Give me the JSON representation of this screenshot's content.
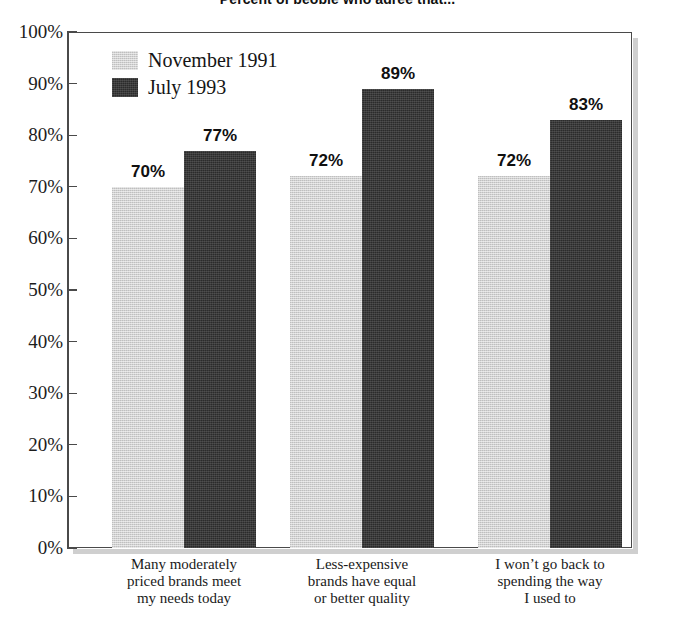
{
  "chart_data": {
    "type": "bar",
    "title": "Percent of people who agree that...",
    "xlabel": "",
    "ylabel": "",
    "ylim": [
      0,
      100
    ],
    "ytick_labels": [
      "100%",
      "90%",
      "80%",
      "70%",
      "60%",
      "50%",
      "40%",
      "30%",
      "20%",
      "10%",
      "0%"
    ],
    "ytick_values": [
      100,
      90,
      80,
      70,
      60,
      50,
      40,
      30,
      20,
      10,
      0
    ],
    "grid": false,
    "legend_position": "inside-top-left",
    "categories": [
      [
        "Many moderately",
        "priced brands meet",
        "my needs today"
      ],
      [
        "Less-expensive",
        "brands have equal",
        "or better quality"
      ],
      [
        "I won’t go back to",
        "spending the way",
        "I used to"
      ]
    ],
    "series": [
      {
        "name": "November 1991",
        "color": "#d2d2d2",
        "values": [
          70,
          72,
          72
        ],
        "labels": [
          "70%",
          "72%",
          "72%"
        ]
      },
      {
        "name": "July 1993",
        "color": "#2b2b2b",
        "values": [
          77,
          89,
          83
        ],
        "labels": [
          "77%",
          "89%",
          "83%"
        ]
      }
    ]
  },
  "legend": {
    "items": [
      {
        "label": "November 1991",
        "swatch": "light-gray-swatch"
      },
      {
        "label": "July 1993",
        "swatch": "dark-swatch"
      }
    ]
  }
}
